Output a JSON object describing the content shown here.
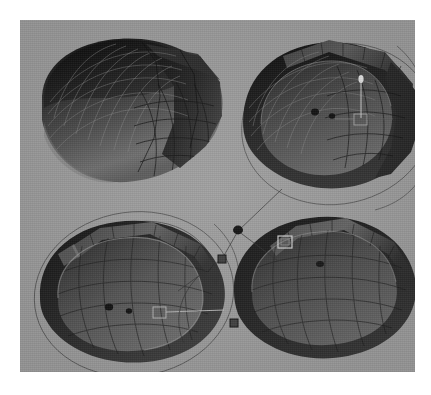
{
  "app": {
    "title": "3D Viewport — Quad View",
    "kind": "3d-modeling-viewport-screenshot"
  },
  "viewport": {
    "background_color": "#9c9c9c",
    "page_background_color": "#ffffff",
    "x": 20,
    "y": 20,
    "width": 395,
    "height": 352,
    "layout": "2x2 quad view",
    "shading_mode": "solid-with-wireframe"
  },
  "palette": {
    "background": "#9c9c9c",
    "shell_dark": "#141414",
    "shell_mid": "#3a3a3a",
    "shell_body": "#5e5e5e",
    "shell_body_light": "#767676",
    "rim_band": "#4a4a4a",
    "wire_light": "#8e8e8e",
    "wire_dark": "#171717",
    "guide_curve": "#3d3d3d",
    "handle_bright": "#d8d8d8",
    "vertex_dot": "#101010"
  },
  "views": [
    {
      "id": "view-top-left",
      "name": "Front Perspective",
      "position": {
        "x": 10,
        "y": 6
      },
      "object": "faceted-shell",
      "has_guide_circles": false,
      "has_vertex_dots": false,
      "has_handles": false,
      "wire_density": "high",
      "note": "closed shell, mesh wireframe visible on upper-left dome"
    },
    {
      "id": "view-top-right",
      "name": "Side Perspective",
      "position": {
        "x": 205,
        "y": 6
      },
      "object": "faceted-shell-open",
      "has_guide_circles": true,
      "has_vertex_dots": true,
      "has_handles": true,
      "wire_density": "high",
      "vertex_dots": 2,
      "handles": [
        "square-handle",
        "pin-handle"
      ],
      "note": "open shell showing interior cavity and rim band"
    },
    {
      "id": "view-bottom-left",
      "name": "Top Perspective",
      "position": {
        "x": 8,
        "y": 182
      },
      "object": "faceted-shell-open",
      "has_guide_circles": true,
      "has_vertex_dots": true,
      "has_handles": true,
      "wire_density": "medium",
      "vertex_dots": 2,
      "handles": [
        "square-handle",
        "node-square"
      ],
      "note": "open shell, large orbit guide circle around object"
    },
    {
      "id": "view-bottom-right",
      "name": "Rear Perspective",
      "position": {
        "x": 198,
        "y": 178
      },
      "object": "faceted-shell-open",
      "has_guide_circles": false,
      "has_vertex_dots": true,
      "has_handles": true,
      "wire_density": "medium",
      "vertex_dots": 1,
      "handles": [
        "square-handle"
      ],
      "note": "open shell viewed from behind with rim selection handle"
    }
  ],
  "gizmos": {
    "floating_nodes": [
      {
        "id": "node-dot-center",
        "shape": "circle",
        "x": 214,
        "y": 210,
        "size": 7
      },
      {
        "id": "node-square-left",
        "shape": "square",
        "x": 200,
        "y": 235,
        "size": 6
      },
      {
        "id": "node-square-right",
        "shape": "square",
        "x": 212,
        "y": 300,
        "size": 6
      }
    ],
    "connector_lines": 4,
    "description": "empties / armature handles linked by thin constraint lines"
  },
  "chart_data": null
}
